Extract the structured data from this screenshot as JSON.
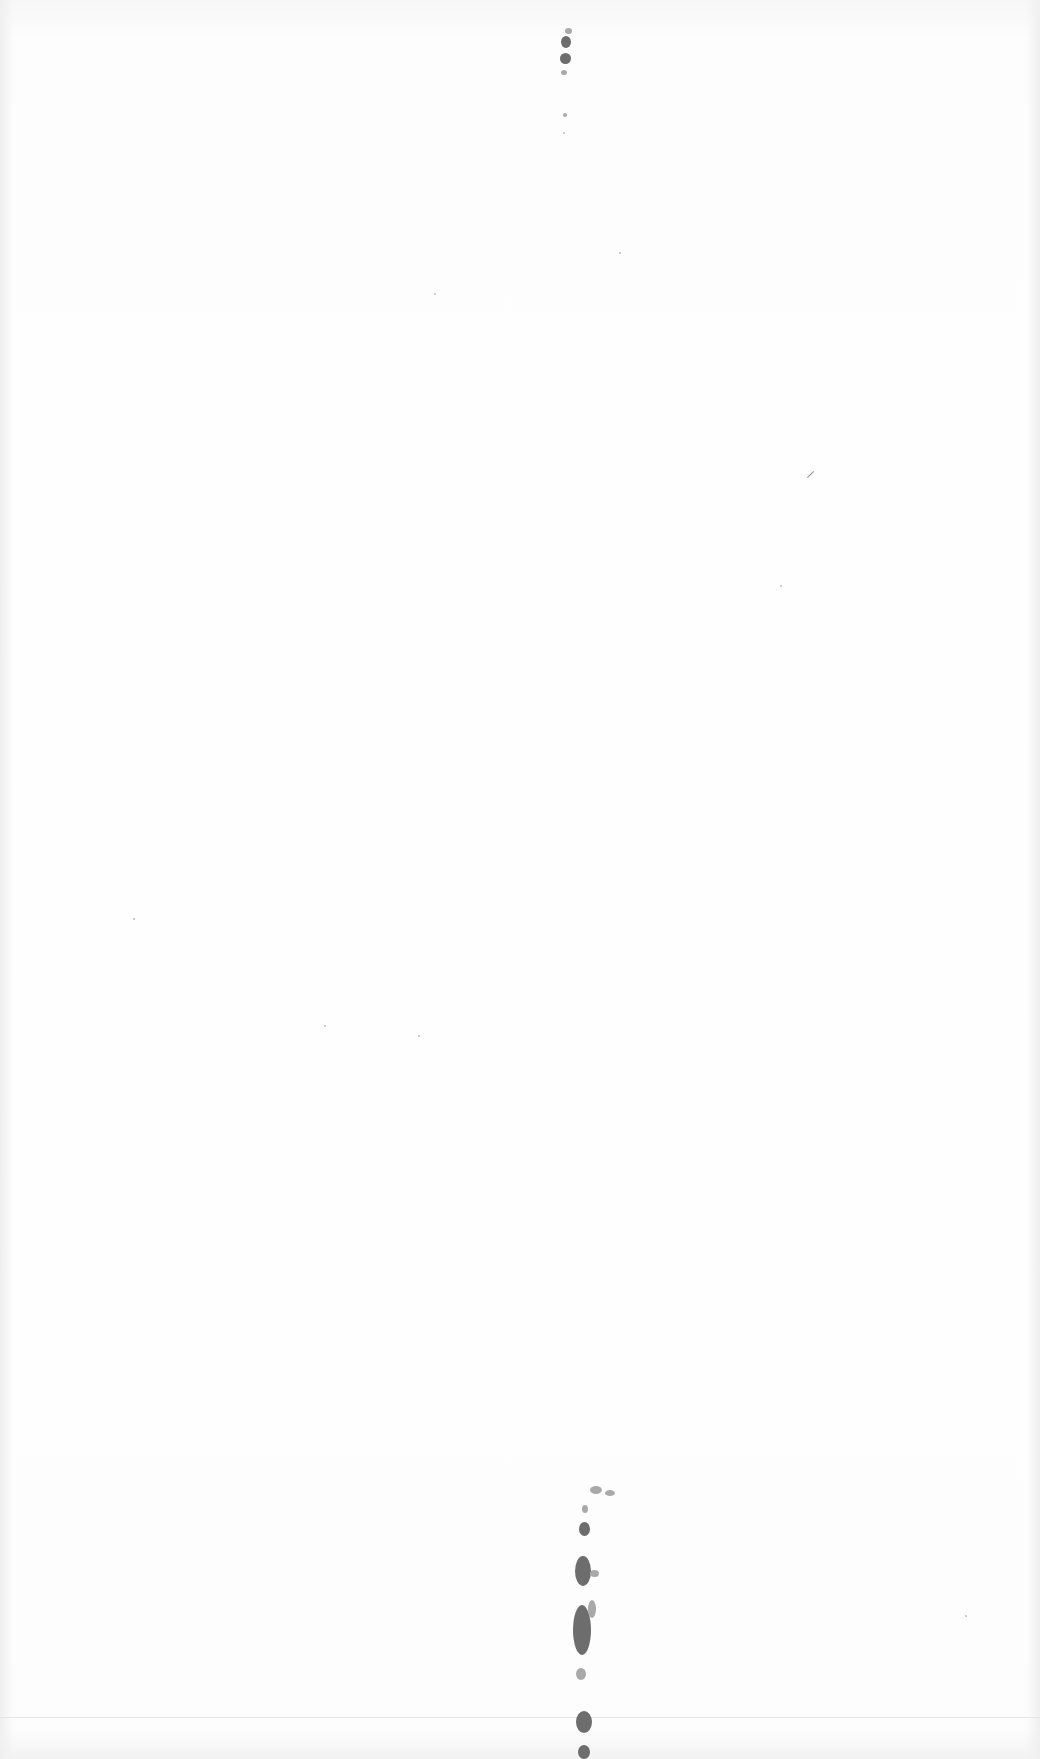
{
  "page": {
    "type": "scanned blank page",
    "background_color": "#fdfdfd",
    "mark_color": "#6d6d6d",
    "text": ""
  }
}
